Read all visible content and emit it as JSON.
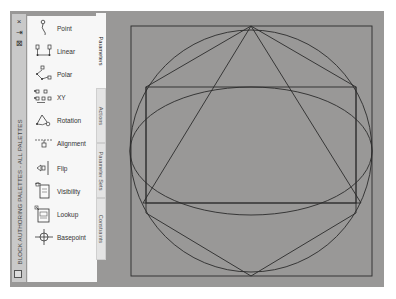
{
  "palette": {
    "title": "BLOCK AUTHORING PALETTES - ALL PALETTES",
    "titlebar_buttons": [
      {
        "name": "close",
        "glyph": "×"
      },
      {
        "name": "auto-hide",
        "glyph": "⇥"
      },
      {
        "name": "properties",
        "glyph": "⊠"
      }
    ],
    "tools": [
      {
        "label": "Point",
        "icon": "point-parameter-icon"
      },
      {
        "label": "Linear",
        "icon": "linear-parameter-icon"
      },
      {
        "label": "Polar",
        "icon": "polar-parameter-icon"
      },
      {
        "label": "XY",
        "icon": "xy-parameter-icon"
      },
      {
        "label": "Rotation",
        "icon": "rotation-parameter-icon"
      },
      {
        "label": "Alignment",
        "icon": "alignment-parameter-icon"
      },
      {
        "label": "Flip",
        "icon": "flip-parameter-icon"
      },
      {
        "label": "Visibility",
        "icon": "visibility-parameter-icon"
      },
      {
        "label": "Lookup",
        "icon": "lookup-parameter-icon"
      },
      {
        "label": "Basepoint",
        "icon": "basepoint-parameter-icon"
      }
    ],
    "tabs": [
      {
        "label": "Parameters",
        "active": true
      },
      {
        "label": "Actions",
        "active": false
      },
      {
        "label": "Parameter Sets",
        "active": false
      },
      {
        "label": "Constraints",
        "active": false
      }
    ]
  },
  "canvas": {
    "background": "#999897",
    "line_color": "#2b2b2b",
    "shapes": [
      {
        "type": "rectangle",
        "name": "outer-square",
        "x": 131,
        "y": 26,
        "w": 241,
        "h": 250
      },
      {
        "type": "circle",
        "name": "circle",
        "cx": 251,
        "cy": 151,
        "r": 121
      },
      {
        "type": "ellipse",
        "name": "ellipse",
        "cx": 251,
        "cy": 151,
        "rx": 121,
        "ry": 64
      },
      {
        "type": "rectangle",
        "name": "inner-rectangle",
        "x": 146,
        "y": 87,
        "w": 210,
        "h": 116
      },
      {
        "type": "polygon",
        "name": "triangle",
        "points": "251,26 143,203 361,203"
      },
      {
        "type": "polygon",
        "name": "hexagon",
        "points": "251,26 356,87 356,213 251,276 146,213 146,87"
      }
    ]
  }
}
